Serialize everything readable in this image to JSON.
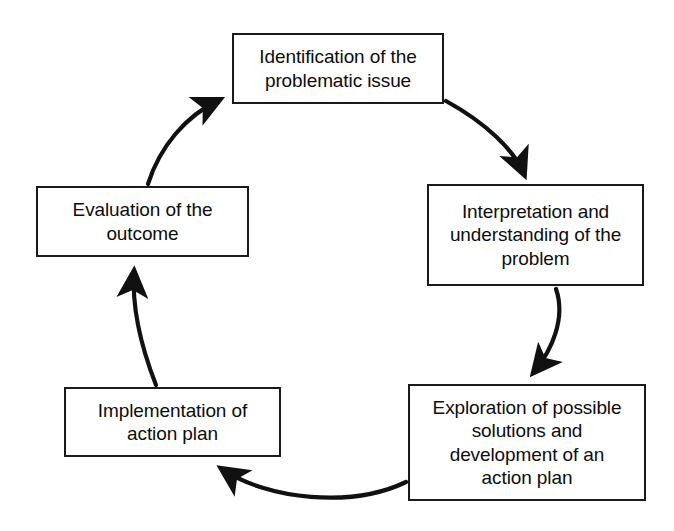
{
  "diagram": {
    "type": "cycle",
    "shape": "circular-flow",
    "background_color": "#ffffff",
    "line_color": "#1a1a1a",
    "text_color": "#0d0d0d",
    "nodes": [
      {
        "id": "identification",
        "order": 1,
        "label": "Identification of the\nproblematic issue",
        "position": "top"
      },
      {
        "id": "interpretation",
        "order": 2,
        "label": "Interpretation and\nunderstanding of the\nproblem",
        "position": "right"
      },
      {
        "id": "exploration",
        "order": 3,
        "label": "Exploration of possible\nsolutions and\ndevelopment of an\naction plan",
        "position": "bottom-right"
      },
      {
        "id": "implementation",
        "order": 4,
        "label": "Implementation of\naction plan",
        "position": "bottom-left"
      },
      {
        "id": "evaluation",
        "order": 5,
        "label": "Evaluation of the\noutcome",
        "position": "left"
      }
    ],
    "connectors": [
      {
        "id": "identification-to-interpretation",
        "from": "identification",
        "to": "interpretation",
        "style": "curved-arrow"
      },
      {
        "id": "interpretation-to-exploration",
        "from": "interpretation",
        "to": "exploration",
        "style": "curved-arrow"
      },
      {
        "id": "exploration-to-implementation",
        "from": "exploration",
        "to": "implementation",
        "style": "curved-arrow"
      },
      {
        "id": "implementation-to-evaluation",
        "from": "implementation",
        "to": "evaluation",
        "style": "curved-arrow"
      },
      {
        "id": "evaluation-to-identification",
        "from": "evaluation",
        "to": "identification",
        "style": "curved-arrow"
      }
    ]
  }
}
